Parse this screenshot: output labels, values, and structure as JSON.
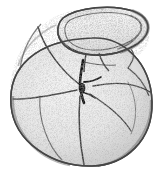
{
  "figure": {
    "kind": "scientific-illustration",
    "view": "umbilical",
    "technique": "stipple-and-line drawing, grayscale",
    "background_color": "#ffffff",
    "ink_color": "#3a3a3a",
    "outline_color": "#555555",
    "shell_fill_light": "#efefef",
    "shell_fill_mid": "#e0e0e0",
    "shell_fill_shadow": "#c9c9c9",
    "stipple_color": "#7c7c7c",
    "aperture_color": "#1a1a1a",
    "canvas": {
      "width": 166,
      "height": 177
    },
    "caption": "",
    "parts": [
      {
        "name": "final-chamber",
        "label": "final chamber with thickened apertural lip",
        "position": "upper"
      },
      {
        "name": "chamber-left",
        "label": "left chamber",
        "position": "left"
      },
      {
        "name": "chamber-lower-left",
        "label": "lower-left chamber",
        "position": "lower-left"
      },
      {
        "name": "chamber-lower-right",
        "label": "lower-right chamber",
        "position": "lower-right"
      },
      {
        "name": "chamber-right",
        "label": "right chamber",
        "position": "right"
      },
      {
        "name": "aperture",
        "label": "umbilical aperture slit",
        "position": "center"
      },
      {
        "name": "suture-lines",
        "label": "radiating sutures",
        "position": "across test"
      },
      {
        "name": "apertural-lip",
        "label": "overhanging rim / lip",
        "position": "upper-right margin"
      }
    ]
  }
}
